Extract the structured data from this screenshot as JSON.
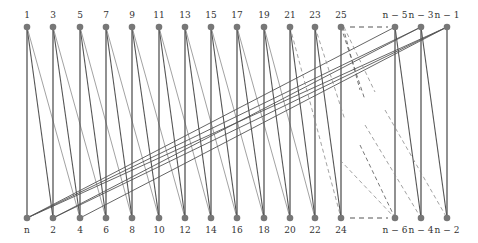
{
  "diagram": {
    "type": "bipartite-graph",
    "top_row": {
      "y": 27,
      "nodes": [
        {
          "label": "1",
          "x": 27
        },
        {
          "label": "3",
          "x": 53
        },
        {
          "label": "5",
          "x": 80
        },
        {
          "label": "7",
          "x": 106
        },
        {
          "label": "9",
          "x": 132
        },
        {
          "label": "11",
          "x": 159
        },
        {
          "label": "13",
          "x": 185
        },
        {
          "label": "15",
          "x": 211
        },
        {
          "label": "17",
          "x": 237
        },
        {
          "label": "19",
          "x": 264
        },
        {
          "label": "21",
          "x": 290
        },
        {
          "label": "23",
          "x": 315
        },
        {
          "label": "25",
          "x": 341
        },
        {
          "label": "n − 5",
          "x": 395
        },
        {
          "label": "n − 3",
          "x": 421
        },
        {
          "label": "n − 1",
          "x": 447
        }
      ]
    },
    "bottom_row": {
      "y": 218,
      "nodes": [
        {
          "label": "n",
          "x": 27
        },
        {
          "label": "2",
          "x": 53
        },
        {
          "label": "4",
          "x": 80
        },
        {
          "label": "6",
          "x": 106
        },
        {
          "label": "8",
          "x": 132
        },
        {
          "label": "10",
          "x": 159
        },
        {
          "label": "12",
          "x": 185
        },
        {
          "label": "14",
          "x": 211
        },
        {
          "label": "16",
          "x": 237
        },
        {
          "label": "18",
          "x": 264
        },
        {
          "label": "20",
          "x": 290
        },
        {
          "label": "22",
          "x": 315
        },
        {
          "label": "24",
          "x": 341
        },
        {
          "label": "n − 6",
          "x": 395
        },
        {
          "label": "n − 4",
          "x": 421
        },
        {
          "label": "n − 2",
          "x": 447
        }
      ]
    },
    "colors": {
      "node": "#777777",
      "edge_dark": "#555555",
      "edge_light": "#8a8a8a",
      "label": "#333333"
    },
    "ellipsis": {
      "top": {
        "from_x": 350,
        "to_x": 388,
        "y": 27
      },
      "bottom": {
        "from_x": 350,
        "to_x": 388,
        "y": 218
      }
    },
    "long_edges": [
      {
        "top": "n − 5",
        "bottom": "n"
      },
      {
        "top": "n − 3",
        "bottom": "n"
      },
      {
        "top": "n − 3",
        "bottom": "2"
      },
      {
        "top": "n − 1",
        "bottom": "n"
      },
      {
        "top": "n − 1",
        "bottom": "2"
      },
      {
        "top": "n − 1",
        "bottom": "4"
      }
    ]
  }
}
